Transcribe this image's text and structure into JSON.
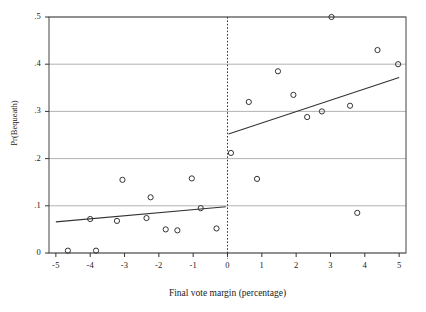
{
  "chart_data": {
    "type": "scatter",
    "title": "",
    "xlabel": "Final vote margin (percentage)",
    "ylabel": "Pr(Bequeath)",
    "xlim": [
      -5.2,
      5.2
    ],
    "ylim": [
      0,
      0.5
    ],
    "xticks": [
      -5,
      -4,
      -3,
      -2,
      -1,
      0,
      1,
      2,
      3,
      4,
      5
    ],
    "xticklabels": [
      "-5",
      "-4",
      "-3",
      "-2",
      "-1",
      "0",
      "1",
      "2",
      "3",
      "4",
      "5"
    ],
    "yticks": [
      0,
      0.1,
      0.2,
      0.3,
      0.4,
      0.5
    ],
    "yticklabels": [
      "0",
      ".1",
      ".2",
      ".3",
      ".4",
      ".5"
    ],
    "grid": "horizontal",
    "legend": "none",
    "marker": "open-circle",
    "marker_color": "#333333",
    "line_color": "#333333",
    "cutoff_line": {
      "x": 0,
      "style": "dotted",
      "color": "#333333"
    },
    "points_left": [
      {
        "x": -4.65,
        "y": 0.005
      },
      {
        "x": -3.83,
        "y": 0.005
      },
      {
        "x": -4.0,
        "y": 0.072
      },
      {
        "x": -3.06,
        "y": 0.155
      },
      {
        "x": -3.22,
        "y": 0.068
      },
      {
        "x": -2.24,
        "y": 0.118
      },
      {
        "x": -2.36,
        "y": 0.074
      },
      {
        "x": -1.8,
        "y": 0.05
      },
      {
        "x": -1.46,
        "y": 0.048
      },
      {
        "x": -1.04,
        "y": 0.158
      },
      {
        "x": -0.78,
        "y": 0.095
      },
      {
        "x": -0.32,
        "y": 0.052
      }
    ],
    "points_right": [
      {
        "x": 0.1,
        "y": 0.212
      },
      {
        "x": 0.62,
        "y": 0.32
      },
      {
        "x": 0.86,
        "y": 0.157
      },
      {
        "x": 1.47,
        "y": 0.385
      },
      {
        "x": 1.92,
        "y": 0.335
      },
      {
        "x": 2.32,
        "y": 0.288
      },
      {
        "x": 2.75,
        "y": 0.3
      },
      {
        "x": 3.03,
        "y": 0.5
      },
      {
        "x": 3.57,
        "y": 0.312
      },
      {
        "x": 3.78,
        "y": 0.085
      },
      {
        "x": 4.37,
        "y": 0.43
      },
      {
        "x": 4.97,
        "y": 0.4
      }
    ],
    "fit_left": {
      "x0": -5.0,
      "y0": 0.066,
      "x1": -0.05,
      "y1": 0.098
    },
    "fit_right": {
      "x0": 0.03,
      "y0": 0.252,
      "x1": 5.0,
      "y1": 0.372
    }
  }
}
